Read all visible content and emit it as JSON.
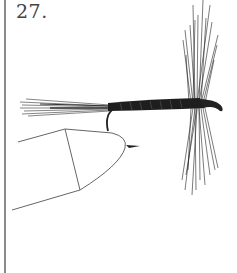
{
  "plate": {
    "number": "27."
  },
  "illustration": {
    "subject": "dry-fly-on-vise",
    "colors": {
      "ink": "#1a1a1a",
      "line": "#555555",
      "rule": "#8a8a8a",
      "background": "#ffffff"
    }
  }
}
